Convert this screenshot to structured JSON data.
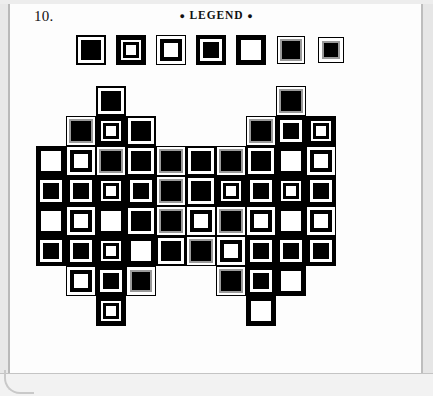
{
  "page": {
    "question_number": "10.",
    "legend_title": "LEGEND",
    "legend_bullet": "●",
    "colors": {
      "ink": "#000000",
      "paper": "#ffffff",
      "gray_ring": "#9a9a9a"
    }
  },
  "legend": {
    "count": 7,
    "symbols": [
      {
        "id": "A",
        "name": "thin-outline-solid-black-center",
        "outer": "#000000",
        "outer_w": 2,
        "gap": "#ffffff",
        "gap_w": 3,
        "inner_ring": "none",
        "core": "#000000",
        "size": 30
      },
      {
        "id": "B",
        "name": "thick-black-border-white-center-black-ring",
        "outer": "#000000",
        "outer_w": 5,
        "gap": "#ffffff",
        "gap_w": 2,
        "inner_ring": "#000000",
        "inner_ring_w": 3,
        "core": "#ffffff",
        "size": 30
      },
      {
        "id": "C",
        "name": "thin-outline-black-ring-white-center",
        "outer": "#000000",
        "outer_w": 1,
        "gap": "#ffffff",
        "gap_w": 3,
        "inner_ring": "#000000",
        "inner_ring_w": 4,
        "core": "#ffffff",
        "size": 30
      },
      {
        "id": "D",
        "name": "thick-black-border-white-gap-black-center",
        "outer": "#000000",
        "outer_w": 4,
        "gap": "#ffffff",
        "gap_w": 3,
        "inner_ring": "none",
        "core": "#000000",
        "size": 30
      },
      {
        "id": "E",
        "name": "thick-black-border-all-white-center",
        "outer": "#000000",
        "outer_w": 5,
        "gap": "#ffffff",
        "gap_w": 0,
        "inner_ring": "none",
        "core": "#ffffff",
        "size": 30
      },
      {
        "id": "F",
        "name": "gray-ring-black-center-large",
        "outer": "#000000",
        "outer_w": 1,
        "gap": "#ffffff",
        "gap_w": 2,
        "inner_ring": "#9a9a9a",
        "inner_ring_w": 2,
        "core": "#000000",
        "size": 28
      },
      {
        "id": "G",
        "name": "gray-ring-black-center-small",
        "outer": "#000000",
        "outer_w": 1,
        "gap": "#ffffff",
        "gap_w": 3,
        "inner_ring": "#9a9a9a",
        "inner_ring_w": 2,
        "core": "#000000",
        "size": 26
      }
    ]
  },
  "grid": {
    "columns": 12,
    "rows": 9,
    "cell_size": 30,
    "origin_x": 36,
    "origin_y": 86,
    "legend_key": "Each cell holds one of the 7 legend symbols; empty string = blank cell",
    "rows_data": [
      [
        "",
        "",
        "A",
        "",
        "",
        "",
        "",
        "",
        "F",
        "",
        "",
        ""
      ],
      [
        "",
        "F",
        "B",
        "A",
        "",
        "",
        "",
        "F",
        "D",
        "B",
        "",
        ""
      ],
      [
        "E",
        "C",
        "F",
        "A",
        "F",
        "A",
        "F",
        "A",
        "E",
        "C",
        "",
        ""
      ],
      [
        "D",
        "D",
        "B",
        "D",
        "F",
        "A",
        "B",
        "D",
        "B",
        "D",
        "",
        ""
      ],
      [
        "E",
        "C",
        "E",
        "A",
        "F",
        "C",
        "F",
        "C",
        "E",
        "C",
        "",
        ""
      ],
      [
        "D",
        "D",
        "B",
        "E",
        "A",
        "F",
        "C",
        "D",
        "D",
        "D",
        "",
        ""
      ],
      [
        "",
        "C",
        "D",
        "G",
        "",
        "",
        "F",
        "D",
        "E",
        "",
        "",
        ""
      ],
      [
        "",
        "",
        "B",
        "",
        "",
        "",
        "",
        "E",
        "",
        "",
        "",
        ""
      ],
      [
        "",
        "",
        "",
        "",
        "",
        "",
        "",
        "",
        "",
        "",
        "",
        ""
      ]
    ]
  }
}
